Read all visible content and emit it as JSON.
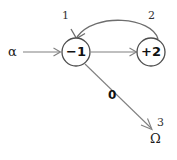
{
  "diagram": {
    "type": "state-transition-diagram",
    "background_color": "#ffffff",
    "line_color": "#808080",
    "node_stroke_color": "#4d4d4d",
    "text_color": "#111111",
    "nodes": [
      {
        "id": "node-1",
        "label": "−1",
        "index_label": "1",
        "shape": "circle",
        "cx": 76,
        "cy": 52,
        "r": 14
      },
      {
        "id": "node-2",
        "label": "+2",
        "index_label": "2",
        "shape": "circle",
        "cx": 151,
        "cy": 52,
        "r": 14
      },
      {
        "id": "node-3",
        "label": "Ω",
        "index_label": "3",
        "shape": "terminal",
        "cx": 156,
        "cy": 139
      }
    ],
    "input": {
      "label": "α",
      "target": "node-1"
    },
    "edges": [
      {
        "from": "input",
        "to": "node-1",
        "style": "straight",
        "label": ""
      },
      {
        "from": "node-1",
        "to": "node-2",
        "style": "straight",
        "label": ""
      },
      {
        "from": "node-2",
        "to": "node-1",
        "style": "curved-arc",
        "label": ""
      },
      {
        "from": "node-1",
        "to": "node-3",
        "style": "diagonal",
        "label": "0"
      }
    ]
  }
}
